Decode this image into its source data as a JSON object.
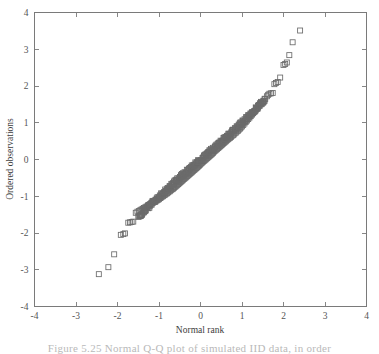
{
  "figure": {
    "caption_fragment": "Figure 5.25 Normal Q-Q plot of simulated IID data, in order"
  },
  "chart_data": {
    "type": "scatter",
    "title": "",
    "xlabel": "Normal rank",
    "ylabel": "Ordered observations",
    "xlim": [
      -4,
      4
    ],
    "ylim": [
      -4,
      4
    ],
    "xticks": [
      -4,
      -3,
      -2,
      -1,
      0,
      1,
      2,
      3,
      4
    ],
    "yticks": [
      -4,
      -3,
      -2,
      -1,
      0,
      1,
      2,
      3,
      4
    ],
    "xticklabels": [
      "-4",
      "-3",
      "-2",
      "-1",
      "0",
      "1",
      "2",
      "3",
      "4"
    ],
    "yticklabels": [
      "-4",
      "-3",
      "-2",
      "-1",
      "0",
      "1",
      "2",
      "3",
      "4"
    ],
    "grid": false,
    "legend": null,
    "marker": "open-square",
    "marker_color": "#6b6b6b",
    "marker_size": 5,
    "series": [
      {
        "name": "Ordered observations vs normal rank",
        "points": [
          [
            -2.45,
            -3.12
          ],
          [
            -2.22,
            -2.93
          ],
          [
            -2.08,
            -2.58
          ],
          [
            -1.92,
            -2.05
          ],
          [
            -1.86,
            -2.03
          ],
          [
            -1.82,
            -2.01
          ],
          [
            -1.74,
            -1.72
          ],
          [
            -1.7,
            -1.71
          ],
          [
            -1.66,
            -1.7
          ],
          [
            -1.62,
            -1.69
          ],
          [
            -1.56,
            -1.45
          ],
          [
            -1.52,
            -1.42
          ],
          [
            -1.48,
            -1.4
          ],
          [
            -1.45,
            -1.38
          ],
          [
            -1.42,
            -1.36
          ],
          [
            -1.39,
            -1.34
          ],
          [
            -1.36,
            -1.32
          ],
          [
            -1.33,
            -1.3
          ],
          [
            -1.3,
            -1.28
          ],
          [
            -1.27,
            -1.26
          ],
          [
            -1.24,
            -1.24
          ],
          [
            -1.21,
            -1.22
          ],
          [
            -1.18,
            -1.2
          ],
          [
            -1.15,
            -1.18
          ],
          [
            -1.12,
            -1.16
          ],
          [
            -1.09,
            -1.14
          ],
          [
            -1.06,
            -1.12
          ],
          [
            -1.03,
            -1.1
          ],
          [
            -1.0,
            -1.08
          ],
          [
            -0.97,
            -1.05
          ],
          [
            -0.95,
            -1.03
          ],
          [
            -0.92,
            -1.01
          ],
          [
            -0.9,
            -0.99
          ],
          [
            -0.87,
            -0.97
          ],
          [
            -0.85,
            -0.95
          ],
          [
            -0.82,
            -0.93
          ],
          [
            -0.8,
            -0.91
          ],
          [
            -0.78,
            -0.89
          ],
          [
            -0.75,
            -0.87
          ],
          [
            -0.73,
            -0.85
          ],
          [
            -0.71,
            -0.83
          ],
          [
            -0.68,
            -0.81
          ],
          [
            -0.66,
            -0.79
          ],
          [
            -0.64,
            -0.77
          ],
          [
            -0.62,
            -0.75
          ],
          [
            -0.6,
            -0.73
          ],
          [
            -0.58,
            -0.71
          ],
          [
            -0.56,
            -0.69
          ],
          [
            -0.54,
            -0.67
          ],
          [
            -0.52,
            -0.65
          ],
          [
            -0.5,
            -0.63
          ],
          [
            -0.48,
            -0.61
          ],
          [
            -0.46,
            -0.59
          ],
          [
            -0.44,
            -0.57
          ],
          [
            -0.42,
            -0.55
          ],
          [
            -0.4,
            -0.53
          ],
          [
            -0.38,
            -0.51
          ],
          [
            -0.36,
            -0.49
          ],
          [
            -0.34,
            -0.47
          ],
          [
            -0.32,
            -0.45
          ],
          [
            -0.3,
            -0.43
          ],
          [
            -0.28,
            -0.41
          ],
          [
            -0.26,
            -0.39
          ],
          [
            -0.24,
            -0.37
          ],
          [
            -0.22,
            -0.35
          ],
          [
            -0.2,
            -0.33
          ],
          [
            -0.18,
            -0.31
          ],
          [
            -0.16,
            -0.29
          ],
          [
            -0.14,
            -0.27
          ],
          [
            -0.12,
            -0.25
          ],
          [
            -0.1,
            -0.23
          ],
          [
            -0.08,
            -0.21
          ],
          [
            -0.06,
            -0.19
          ],
          [
            -0.04,
            -0.17
          ],
          [
            -0.02,
            -0.15
          ],
          [
            0.0,
            -0.12
          ],
          [
            0.02,
            -0.1
          ],
          [
            0.04,
            -0.08
          ],
          [
            0.06,
            -0.06
          ],
          [
            0.08,
            -0.04
          ],
          [
            0.1,
            -0.02
          ],
          [
            0.12,
            0.0
          ],
          [
            0.14,
            0.02
          ],
          [
            0.16,
            0.04
          ],
          [
            0.18,
            0.06
          ],
          [
            0.2,
            0.08
          ],
          [
            0.22,
            0.1
          ],
          [
            0.24,
            0.12
          ],
          [
            0.26,
            0.14
          ],
          [
            0.28,
            0.16
          ],
          [
            0.3,
            0.18
          ],
          [
            0.32,
            0.21
          ],
          [
            0.34,
            0.23
          ],
          [
            0.36,
            0.25
          ],
          [
            0.38,
            0.27
          ],
          [
            0.4,
            0.29
          ],
          [
            0.42,
            0.31
          ],
          [
            0.44,
            0.33
          ],
          [
            0.46,
            0.35
          ],
          [
            0.48,
            0.37
          ],
          [
            0.5,
            0.39
          ],
          [
            0.52,
            0.41
          ],
          [
            0.54,
            0.43
          ],
          [
            0.56,
            0.45
          ],
          [
            0.58,
            0.47
          ],
          [
            0.6,
            0.49
          ],
          [
            0.62,
            0.51
          ],
          [
            0.64,
            0.53
          ],
          [
            0.66,
            0.55
          ],
          [
            0.68,
            0.57
          ],
          [
            0.71,
            0.59
          ],
          [
            0.73,
            0.61
          ],
          [
            0.75,
            0.64
          ],
          [
            0.78,
            0.66
          ],
          [
            0.8,
            0.68
          ],
          [
            0.82,
            0.71
          ],
          [
            0.85,
            0.73
          ],
          [
            0.87,
            0.76
          ],
          [
            0.9,
            0.78
          ],
          [
            0.92,
            0.81
          ],
          [
            0.95,
            0.84
          ],
          [
            0.97,
            0.87
          ],
          [
            1.0,
            0.9
          ],
          [
            1.03,
            0.94
          ],
          [
            1.06,
            0.98
          ],
          [
            1.09,
            1.02
          ],
          [
            1.12,
            1.06
          ],
          [
            1.15,
            1.1
          ],
          [
            1.18,
            1.14
          ],
          [
            1.21,
            1.18
          ],
          [
            1.24,
            1.22
          ],
          [
            1.27,
            1.26
          ],
          [
            1.3,
            1.3
          ],
          [
            1.33,
            1.34
          ],
          [
            1.36,
            1.38
          ],
          [
            1.39,
            1.42
          ],
          [
            1.42,
            1.46
          ],
          [
            1.45,
            1.5
          ],
          [
            1.48,
            1.55
          ],
          [
            1.52,
            1.6
          ],
          [
            1.56,
            1.65
          ],
          [
            1.6,
            1.72
          ],
          [
            1.63,
            1.76
          ],
          [
            1.66,
            1.79
          ],
          [
            1.7,
            1.8
          ],
          [
            1.74,
            1.81
          ],
          [
            1.78,
            2.05
          ],
          [
            1.82,
            2.08
          ],
          [
            1.86,
            2.11
          ],
          [
            1.92,
            2.23
          ],
          [
            2.0,
            2.57
          ],
          [
            2.04,
            2.6
          ],
          [
            2.08,
            2.64
          ],
          [
            2.14,
            2.84
          ],
          [
            2.22,
            3.19
          ],
          [
            2.4,
            3.51
          ]
        ]
      }
    ],
    "dense_band": {
      "description": "Heavily overlapping open-square markers forming a near-continuous band along the diagonal between x=-1.5 and x=1.5",
      "x_start": -1.5,
      "x_end": 1.55,
      "count": 260
    }
  }
}
